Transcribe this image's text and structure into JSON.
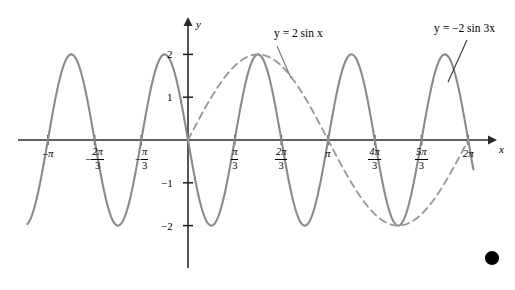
{
  "chart_data": {
    "type": "line",
    "title": "",
    "xlabel": "x",
    "ylabel": "y",
    "xlim": [
      -3.665,
      6.807
    ],
    "ylim": [
      -2.6,
      2.6
    ],
    "grid": false,
    "legend": "inline-annotations",
    "x_tick_labels": [
      "-π",
      "-2π/3",
      "-π/3",
      "π/3",
      "2π/3",
      "π",
      "4π/3",
      "5π/3",
      "2π"
    ],
    "x_tick_values": [
      -3.1416,
      -2.0944,
      -1.0472,
      1.0472,
      2.0944,
      3.1416,
      4.1888,
      5.236,
      6.2832
    ],
    "y_tick_labels": [
      "2",
      "1",
      "-1",
      "-2"
    ],
    "y_tick_values": [
      2,
      1,
      -1,
      -2
    ],
    "series": [
      {
        "name": "y = -2 sin 3x",
        "expression": "-2*sin(3*x)",
        "amplitude": 2,
        "period": 2.0944,
        "style": "solid",
        "color": "#8a8a8a",
        "x_start": -3.6,
        "x_end": 6.4
      },
      {
        "name": "y = 2 sin x",
        "expression": "2*sin(x)",
        "amplitude": 2,
        "period": 6.2832,
        "style": "dashed",
        "color": "#9a9a9a",
        "x_start": 0,
        "x_end": 6.2832
      }
    ],
    "annotations": [
      {
        "text": "y = 2 sin x",
        "x_px": 274,
        "y_px": 33
      },
      {
        "text": "y = -2 sin 3x",
        "x_px": 434,
        "y_px": 28
      }
    ]
  },
  "axes": {
    "y_axis_label": "y",
    "x_axis_label": "x"
  },
  "x_ticks": [
    {
      "sign": "-",
      "whole": "π",
      "num": "",
      "den": ""
    },
    {
      "sign": "-",
      "whole": "",
      "num": "2π",
      "den": "3"
    },
    {
      "sign": "-",
      "whole": "",
      "num": "π",
      "den": "3"
    },
    {
      "sign": "",
      "whole": "",
      "num": "π",
      "den": "3"
    },
    {
      "sign": "",
      "whole": "",
      "num": "2π",
      "den": "3"
    },
    {
      "sign": "",
      "whole": "π",
      "num": "",
      "den": ""
    },
    {
      "sign": "",
      "whole": "",
      "num": "4π",
      "den": "3"
    },
    {
      "sign": "",
      "whole": "",
      "num": "5π",
      "den": "3"
    },
    {
      "sign": "",
      "whole": "2π",
      "num": "",
      "den": ""
    }
  ],
  "y_ticks": [
    {
      "label": "2"
    },
    {
      "label": "1"
    },
    {
      "label": "−1"
    },
    {
      "label": "−2"
    }
  ],
  "function_labels": {
    "dashed": "y = 2 sin x",
    "solid": "y = −2 sin 3x"
  },
  "marker": {
    "name": "bullet",
    "color": "#000000"
  }
}
